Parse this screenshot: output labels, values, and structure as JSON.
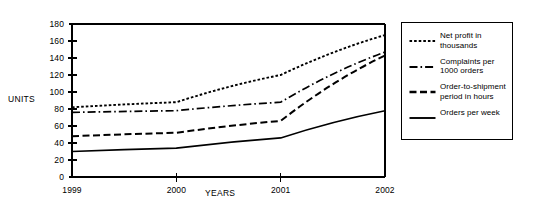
{
  "chart_data": {
    "type": "line",
    "title": "",
    "xlabel": "YEARS",
    "ylabel": "UNITS",
    "categories": [
      "1999",
      "2000",
      "2001",
      "2002"
    ],
    "x": [
      1999,
      2000,
      2001,
      2002
    ],
    "xlim": [
      1999,
      2002
    ],
    "ylim": [
      0,
      180
    ],
    "yticks": [
      "180",
      "160",
      "140",
      "120",
      "100",
      "80",
      "60",
      "40",
      "20",
      "0"
    ],
    "ytick_values": [
      180,
      160,
      140,
      120,
      100,
      80,
      60,
      40,
      20,
      0
    ],
    "ytick_step": 20,
    "grid": false,
    "legend_position": "right-outside",
    "series": [
      {
        "name": "Net profit in thousands",
        "style": "dotted",
        "color": "#000000",
        "values": [
          82,
          88,
          120,
          167
        ]
      },
      {
        "name": "Complaints per 1000 orders",
        "style": "dash-dot",
        "color": "#000000",
        "values": [
          76,
          78,
          88,
          147
        ]
      },
      {
        "name": "Order-to-shipment period in hours",
        "style": "dashed",
        "color": "#000000",
        "values": [
          48,
          52,
          66,
          143
        ]
      },
      {
        "name": "Orders per week",
        "style": "solid",
        "color": "#000000",
        "values": [
          30,
          34,
          46,
          78
        ]
      }
    ]
  },
  "legend": {
    "entries": [
      {
        "line1": "Net profit in",
        "line2": "thousands"
      },
      {
        "line1": "Complaints per",
        "line2": "1000 orders"
      },
      {
        "line1": "Order-to-shipment",
        "line2": "period in hours"
      },
      {
        "line1": "Orders per week",
        "line2": ""
      }
    ]
  }
}
